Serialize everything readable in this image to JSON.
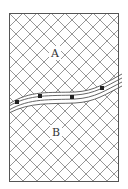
{
  "diagram": {
    "frame": {
      "x": 9.5,
      "y": 13.5,
      "width": 109,
      "height": 168
    },
    "hatch": {
      "spacing": 14,
      "color": "#8a8a8a"
    },
    "colors": {
      "frame": "#555555",
      "band": "#555555",
      "marker": "#222222",
      "background": "#ffffff"
    },
    "regions": [
      {
        "id": "A",
        "label": "A",
        "x": 55,
        "y": 57
      },
      {
        "id": "B",
        "label": "B",
        "x": 56,
        "y": 136
      }
    ],
    "band": {
      "lines": [
        "M9,104 C30,90 50,93 75,92 C95,91 105,83 122,74",
        "M9,106 C30,94 50,96 75,95 C95,94 106,86 122,78",
        "M9,110 C30,98 50,100 75,99 C95,98 106,90 122,82",
        "M9,113 C30,102 50,104 75,103 C95,102 106,94 122,86"
      ],
      "markers": [
        {
          "x": 17,
          "y": 102
        },
        {
          "x": 40,
          "y": 96
        },
        {
          "x": 72,
          "y": 97
        },
        {
          "x": 102,
          "y": 88
        }
      ]
    }
  }
}
